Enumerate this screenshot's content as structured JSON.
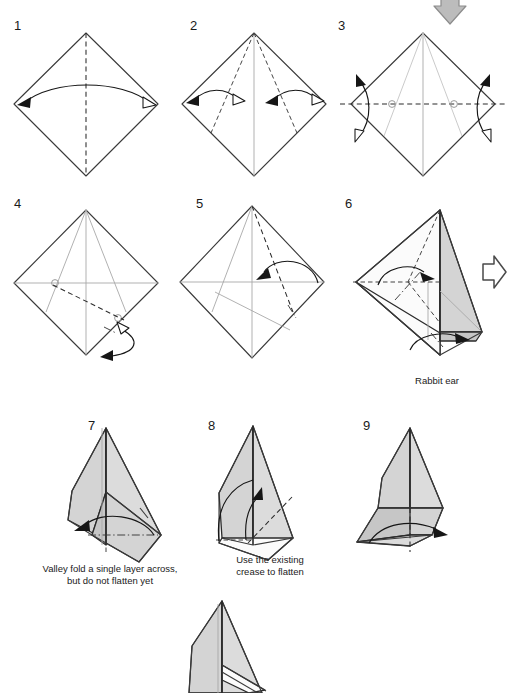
{
  "document": {
    "kind": "origami-folding-instructions",
    "title": "Origami Rabbit Ear Fold Sequence",
    "background_color": "#ffffff",
    "paper_gray": "#d4d4d4",
    "line_color": "#2b2b2b"
  },
  "steps": [
    {
      "id": "step-1",
      "number": "1",
      "number_x": 14,
      "number_y": 30,
      "caption": "",
      "instruction": "Fold left corner to right corner and unfold",
      "fold_lines": [
        "vertical valley crease"
      ],
      "arrows": [
        "double-headed curved arrow left-right"
      ]
    },
    {
      "id": "step-2",
      "number": "2",
      "number_x": 190,
      "number_y": 30,
      "caption": "",
      "instruction": "Fold both lower edges to the vertical center crease and unfold",
      "fold_lines": [
        "two valley creases from top vertex"
      ],
      "arrows": [
        "curved arrow left",
        "curved arrow right"
      ]
    },
    {
      "id": "step-3",
      "number": "3",
      "number_x": 338,
      "number_y": 30,
      "caption": "",
      "instruction": "Fold and unfold along the horizontal line",
      "fold_lines": [
        "horizontal valley crease"
      ],
      "arrows": [
        "fold-and-unfold arrow left",
        "fold-and-unfold arrow right"
      ]
    },
    {
      "id": "step-4",
      "number": "4",
      "number_x": 14,
      "number_y": 208,
      "caption": "",
      "instruction": "Fold the bottom corner up along the dashed line and unfold",
      "fold_lines": [
        "diagonal valley crease"
      ],
      "arrows": [
        "fold-and-unfold arrow bottom-right"
      ]
    },
    {
      "id": "step-5",
      "number": "5",
      "number_x": 196,
      "number_y": 208,
      "caption": "",
      "instruction": "Fold the right edge over to the left",
      "fold_lines": [
        "valley crease from top vertex"
      ],
      "arrows": [
        "curved arrow pointing left"
      ]
    },
    {
      "id": "step-6",
      "number": "6",
      "number_x": 345,
      "number_y": 208,
      "caption": "Rabbit ear",
      "caption_x": 437,
      "caption_y": 384,
      "instruction": "Form a rabbit ear using the existing creases",
      "fold_lines": [
        "valley crease",
        "mountain crease"
      ],
      "arrows": [
        "curved arrow to center",
        "curved arrow to right",
        "large hollow turn arrow"
      ]
    },
    {
      "id": "step-7",
      "number": "7",
      "number_x": 88,
      "number_y": 430,
      "caption_line_1": "Valley fold a single layer across,",
      "caption_line_2": "but do not flatten yet",
      "caption_x": 110,
      "caption_y": 572,
      "instruction": "Valley fold a single layer across, but do not flatten yet",
      "fold_lines": [
        "mountain crease horizontal"
      ],
      "arrows": [
        "curved arrow pointing left"
      ]
    },
    {
      "id": "step-8",
      "number": "8",
      "number_x": 208,
      "number_y": 430,
      "caption_line_1": "Use the existing",
      "caption_line_2": "crease to flatten",
      "caption_x": 270,
      "caption_y": 563,
      "instruction": "Use the existing crease to flatten",
      "fold_lines": [
        "valley crease diagonal"
      ],
      "arrows": [
        "curved arrow pointing up"
      ]
    },
    {
      "id": "step-9",
      "number": "9",
      "number_x": 363,
      "number_y": 430,
      "caption": "",
      "instruction": "Unfold / swing the flap out to the right",
      "fold_lines": [
        "valley crease vertical"
      ],
      "arrows": [
        "curved arrow pointing right"
      ]
    },
    {
      "id": "step-10-partial",
      "number": "",
      "caption": "",
      "instruction": "Resulting shape (partially shown, cropped at bottom edge)",
      "fold_lines": [],
      "arrows": []
    }
  ],
  "symbols": {
    "valley_fold": "dashed line",
    "mountain_fold": "dash-dot line",
    "existing_crease": "thin gray line",
    "fold_arrow_solid": "solid black arrowhead",
    "fold_arrow_hollow": "hollow white arrowhead",
    "turn_over_arrow": "large hollow block arrow"
  }
}
